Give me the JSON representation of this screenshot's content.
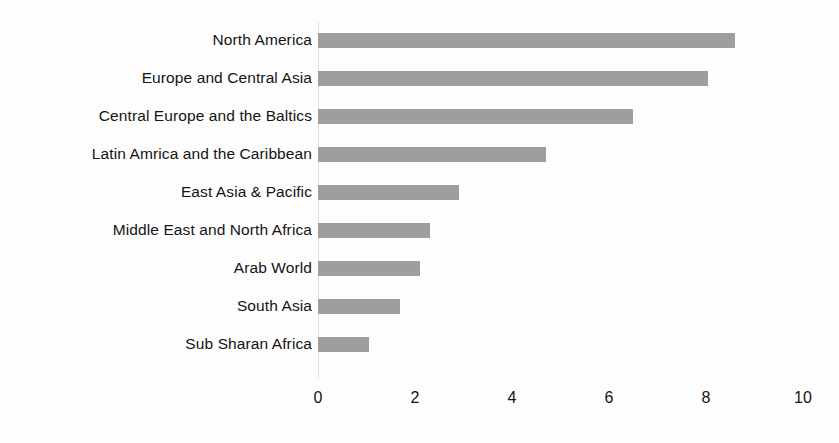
{
  "chart_data": {
    "type": "bar",
    "orientation": "horizontal",
    "title": "",
    "subtitle": "",
    "xlabel": "",
    "ylabel": "",
    "xlim": [
      0,
      10
    ],
    "xticks": [
      "0",
      "2",
      "4",
      "6",
      "8",
      "10"
    ],
    "xtick_values": [
      0,
      2,
      4,
      6,
      8,
      10
    ],
    "grid": false,
    "legend": false,
    "bar_color": "#9e9e9e",
    "background_color": "#fdfdfd",
    "axis_color": "#e2e2e2",
    "categories": [
      "North America",
      "Europe and Central Asia",
      "Central Europe and the Baltics",
      "Latin Amrica and the Caribbean",
      "East Asia & Pacific",
      "Middle East and North Africa",
      "Arab World",
      "South Asia",
      "Sub Sharan Africa"
    ],
    "values": [
      8.6,
      8.05,
      6.5,
      4.7,
      2.9,
      2.3,
      2.1,
      1.7,
      1.05
    ]
  }
}
